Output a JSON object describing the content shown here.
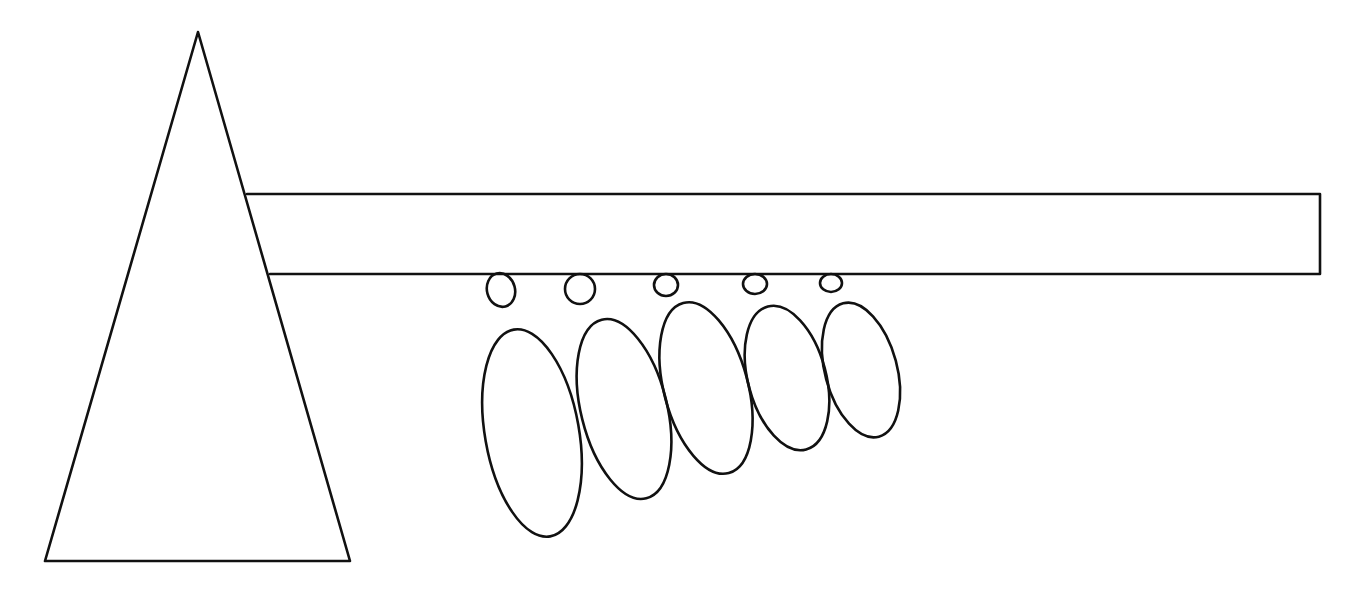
{
  "diagram": {
    "background": "#ffffff",
    "stroke_color": "#111111",
    "stroke_width": 2.6,
    "triangle": {
      "label": "triangle",
      "points": "198,32 45,561 350,561"
    },
    "bar": {
      "label": "horizontal bar",
      "points": "247,194 1320,194 1320,274 270,274"
    },
    "small_loops": [
      {
        "cx": 501,
        "cy": 290,
        "rx": 14,
        "ry": 17,
        "rotate": -15
      },
      {
        "cx": 580,
        "cy": 289,
        "rx": 15,
        "ry": 15,
        "rotate": 0
      },
      {
        "cx": 666,
        "cy": 285,
        "rx": 12,
        "ry": 11,
        "rotate": 0
      },
      {
        "cx": 755,
        "cy": 284,
        "rx": 12,
        "ry": 10,
        "rotate": 0
      },
      {
        "cx": 831,
        "cy": 283,
        "rx": 11,
        "ry": 9,
        "rotate": 0
      }
    ],
    "ovals": [
      {
        "cx": 532,
        "cy": 433,
        "rx": 47,
        "ry": 105,
        "rotate": -10
      },
      {
        "cx": 624,
        "cy": 409,
        "rx": 43,
        "ry": 92,
        "rotate": -14
      },
      {
        "cx": 706,
        "cy": 388,
        "rx": 42,
        "ry": 88,
        "rotate": -15
      },
      {
        "cx": 787,
        "cy": 378,
        "rx": 39,
        "ry": 74,
        "rotate": -15
      },
      {
        "cx": 861,
        "cy": 370,
        "rx": 36,
        "ry": 69,
        "rotate": -15
      }
    ]
  }
}
